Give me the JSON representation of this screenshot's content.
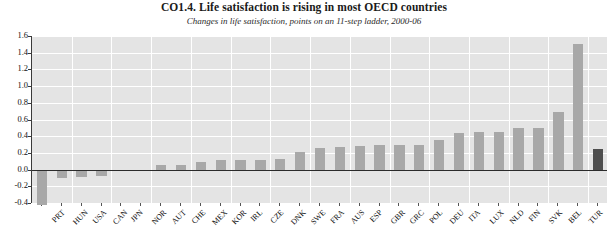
{
  "chart_data": {
    "type": "bar",
    "title": "CO1.4.  Life satisfaction is rising in most OECD countries",
    "subtitle": "Changes in life satisfaction, points on an 11-step ladder, 2000-06",
    "xlabel": "",
    "ylabel": "",
    "ylim": [
      -0.4,
      1.6
    ],
    "ytick_step": 0.2,
    "grid": true,
    "legend": false,
    "bar_color": "#a8a8a8",
    "highlight_color": "#4f4f4f",
    "plot_background": "#e4e4e4",
    "gridline_color": "#ffffff",
    "zero_line_color": "#2b2b2b",
    "highlight_category": "OECD28",
    "ytick_labels": [
      "1.6",
      "1.4",
      "1.2",
      "1.0",
      "0.8",
      "0.6",
      "0.4",
      "0.2",
      "0.0",
      "-0.2",
      "-0.4"
    ],
    "ytick_values": [
      1.6,
      1.4,
      1.2,
      1.0,
      0.8,
      0.6,
      0.4,
      0.2,
      0.0,
      -0.2,
      -0.4
    ],
    "categories": [
      "PRT",
      "HUN",
      "USA",
      "CAN",
      "JPN",
      "NOR",
      "AUT",
      "CHE",
      "MEX",
      "KOR",
      "IRL",
      "CZE",
      "DNK",
      "SWE",
      "FRA",
      "AUS",
      "ESP",
      "GBR",
      "GRC",
      "POL",
      "DEU",
      "ITA",
      "LUX",
      "NLD",
      "FIN",
      "SVK",
      "BEL",
      "TUR",
      "OECD28"
    ],
    "values": [
      -0.42,
      -0.1,
      -0.09,
      -0.08,
      -0.02,
      -0.01,
      0.05,
      0.06,
      0.09,
      0.11,
      0.12,
      0.12,
      0.13,
      0.21,
      0.26,
      0.27,
      0.28,
      0.29,
      0.29,
      0.3,
      0.35,
      0.44,
      0.45,
      0.45,
      0.5,
      0.5,
      0.69,
      1.5,
      0.25
    ]
  }
}
